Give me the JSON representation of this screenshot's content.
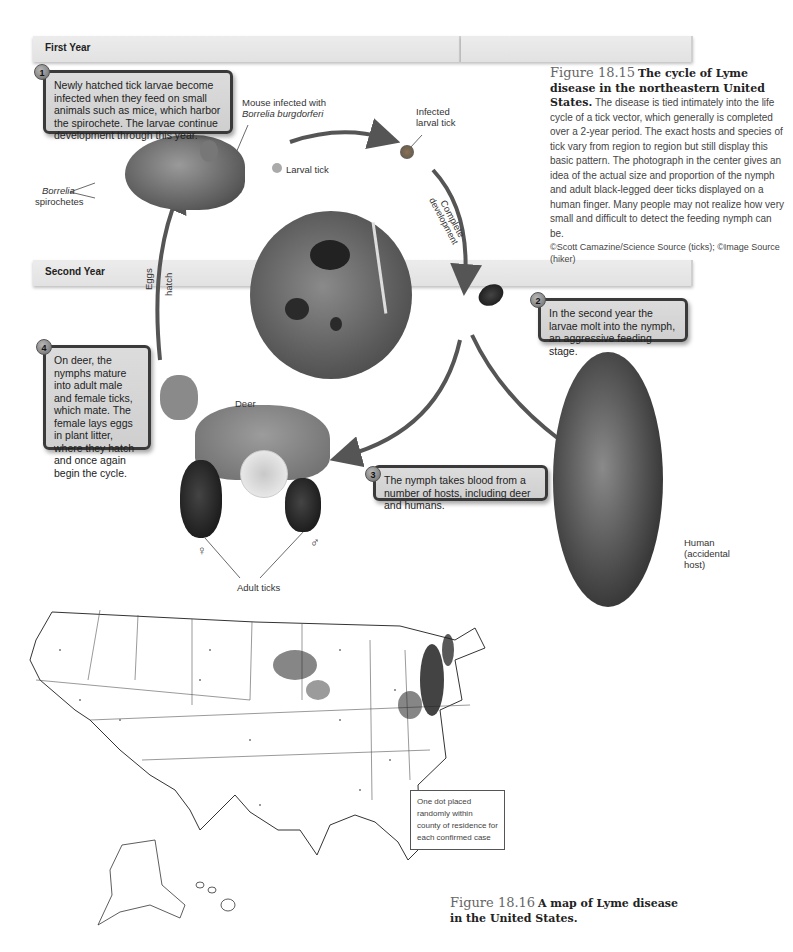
{
  "figure_15": {
    "bands": {
      "first_year": "First Year",
      "second_year": "Second Year"
    },
    "steps": [
      {
        "number": "1",
        "text": "Newly hatched tick larvae become infected when they feed on small animals such as mice, which harbor the spirochete. The larvae continue development through this year."
      },
      {
        "number": "2",
        "text": "In the second year the larvae molt into the nymph, an aggressive feeding stage."
      },
      {
        "number": "3",
        "text": "The nymph takes blood from a number of hosts, including deer and humans."
      },
      {
        "number": "4",
        "text": "On deer, the nymphs mature into adult male and female ticks, which mate. The female lays eggs in plant litter, where they hatch and once again begin the cycle."
      }
    ],
    "labels": {
      "mouse_line1": "Mouse infected with",
      "mouse_line2": "Borrelia burgdorferi",
      "borrelia": "Borrelia",
      "spirochetes": "spirochetes",
      "larval_tick": "Larval tick",
      "infected_line1": "Infected",
      "infected_line2": "larval tick",
      "complete": "Complete",
      "development": "development",
      "eggs": "Eggs",
      "hatch": "hatch",
      "deer": "Deer",
      "adult_ticks": "Adult ticks",
      "female_symbol": "♀",
      "male_symbol": "♂",
      "human_line1": "Human",
      "human_line2": "(accidental",
      "human_line3": "host)"
    },
    "caption": {
      "number": "Figure 18.15",
      "title": "The cycle of Lyme disease in the northeastern United States.",
      "body": "The disease is tied intimately into the life cycle of a tick vector, which generally is completed over a 2-year period. The exact hosts and species of tick vary from region to region but still display this basic pattern. The photograph in the center gives an idea of the actual size and proportion of the nymph and adult black-legged deer ticks displayed on a human finger. Many people may not realize how very small and difficult to detect the feeding nymph can be.",
      "credit": "©Scott Camazine/Science Source (ticks); ©Image Source (hiker)"
    }
  },
  "figure_16": {
    "legend": "One dot placed randomly within county of residence for each confirmed case",
    "caption": {
      "number": "Figure 18.16",
      "title": "A map of Lyme disease in the United States."
    }
  }
}
